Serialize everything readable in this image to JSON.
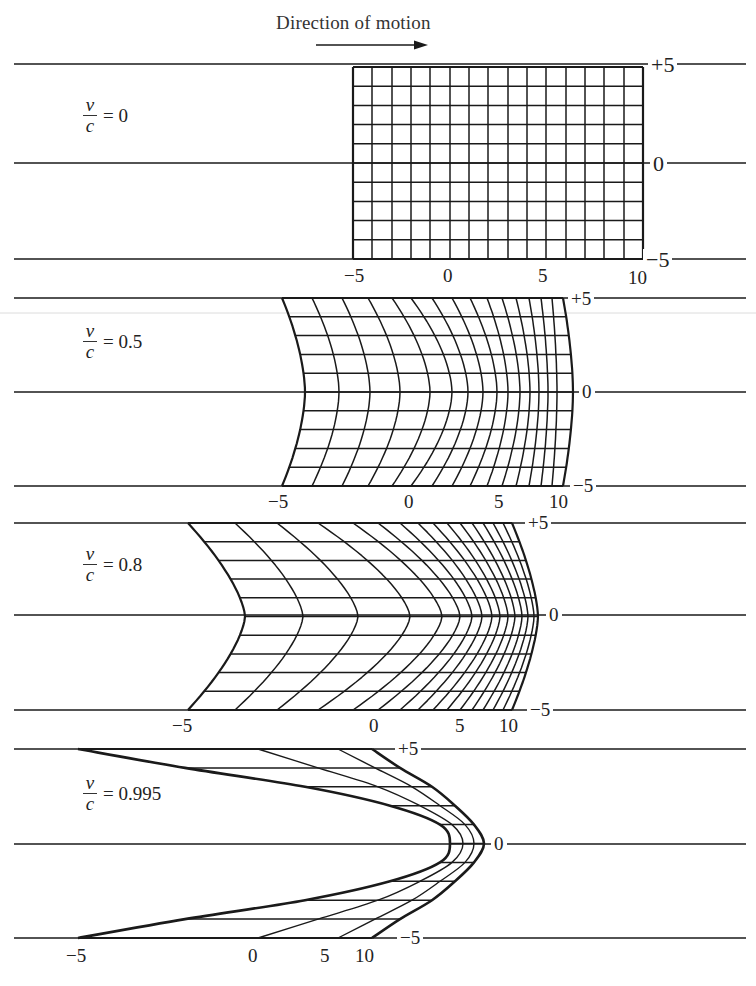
{
  "header": {
    "title": "Direction of motion",
    "arrow": "right-arrow"
  },
  "panels": [
    {
      "id": "v0",
      "ratio_label": {
        "num": "v",
        "den": "c",
        "value": "= 0"
      },
      "beta": 0,
      "ref_lines_y": [
        64,
        163,
        259
      ],
      "rows_y_px": {
        "top": 67,
        "bottom": 259
      },
      "edge_px": [
        353,
        372,
        392,
        411,
        430,
        450,
        469,
        488,
        508,
        527,
        546,
        566,
        585,
        604,
        624,
        643
      ],
      "center_px": [
        353,
        372,
        392,
        411,
        430,
        450,
        469,
        488,
        508,
        527,
        546,
        566,
        585,
        604,
        624,
        643
      ],
      "profile_power": 1.0,
      "x_labels": [
        {
          "text": "−5",
          "x": 344,
          "y": 266
        },
        {
          "text": "0",
          "x": 443,
          "y": 266
        },
        {
          "text": "5",
          "x": 538,
          "y": 266
        },
        {
          "text": "10",
          "x": 628,
          "y": 268
        }
      ],
      "y_labels": [
        {
          "text": "+5",
          "x": 648,
          "y": 54
        },
        {
          "text": "0",
          "x": 650,
          "y": 153
        },
        {
          "text": "−5",
          "x": 643,
          "y": 249
        }
      ],
      "label_pos": {
        "x": 83,
        "y": 96
      }
    },
    {
      "id": "v05",
      "ratio_label": {
        "num": "v",
        "den": "c",
        "value": "= 0.5"
      },
      "beta": 0.5,
      "ref_lines_y": [
        298,
        392,
        486
      ],
      "rows_y_px": {
        "top": 298,
        "bottom": 486
      },
      "edge_px": [
        282,
        312,
        342,
        368,
        392,
        411,
        432,
        452,
        470,
        487,
        502,
        516,
        529,
        541,
        552,
        563
      ],
      "center_px": [
        305,
        339,
        370,
        400,
        430,
        452,
        468,
        483,
        497,
        508,
        520,
        530,
        539,
        548,
        557,
        573
      ],
      "profile_power": 1.7,
      "x_labels": [
        {
          "text": "−5",
          "x": 268,
          "y": 492
        },
        {
          "text": "0",
          "x": 404,
          "y": 492
        },
        {
          "text": "5",
          "x": 494,
          "y": 492
        },
        {
          "text": "10",
          "x": 549,
          "y": 492
        }
      ],
      "y_labels": [
        {
          "text": "+5",
          "x": 568,
          "y": 289
        },
        {
          "text": "0",
          "x": 579,
          "y": 382
        },
        {
          "text": "−5",
          "x": 570,
          "y": 476
        }
      ],
      "label_pos": {
        "x": 83,
        "y": 322
      }
    },
    {
      "id": "v08",
      "ratio_label": {
        "num": "v",
        "den": "c",
        "value": "= 0.8"
      },
      "beta": 0.8,
      "ref_lines_y": [
        523,
        615,
        710
      ],
      "rows_y_px": {
        "top": 523,
        "bottom": 710
      },
      "edge_px": [
        188,
        235,
        277,
        318,
        353,
        378,
        400,
        418,
        433,
        447,
        460,
        472,
        483,
        493,
        503,
        512
      ],
      "center_px": [
        245,
        303,
        358,
        410,
        442,
        460,
        472,
        482,
        492,
        500,
        508,
        515,
        522,
        528,
        534,
        538
      ],
      "profile_power": 1.5,
      "x_labels": [
        {
          "text": "−5",
          "x": 172,
          "y": 716
        },
        {
          "text": "0",
          "x": 369,
          "y": 716
        },
        {
          "text": "5",
          "x": 455,
          "y": 716
        },
        {
          "text": "10",
          "x": 499,
          "y": 716
        }
      ],
      "y_labels": [
        {
          "text": "+5",
          "x": 525,
          "y": 513
        },
        {
          "text": "0",
          "x": 546,
          "y": 605
        },
        {
          "text": "−5",
          "x": 527,
          "y": 700
        }
      ],
      "label_pos": {
        "x": 83,
        "y": 545
      }
    },
    {
      "id": "v0995",
      "ratio_label": {
        "num": "v",
        "den": "c",
        "value": "= 0.995"
      },
      "beta": 0.995,
      "ref_lines_y": [
        749,
        844,
        938
      ],
      "rows_y_px": {
        "top": 749,
        "bottom": 938
      },
      "sampled_curves": [
        {
          "x": -5,
          "px_by_abs_row": [
            450,
            440,
            390,
            305,
            185,
            78
          ]
        },
        {
          "x": 0,
          "px_by_abs_row": [
            463,
            452,
            420,
            378,
            318,
            258
          ]
        },
        {
          "x": 5,
          "px_by_abs_row": [
            474,
            465,
            440,
            412,
            375,
            338
          ]
        },
        {
          "x": 10,
          "px_by_abs_row": [
            484,
            474,
            455,
            432,
            400,
            372
          ]
        }
      ],
      "x_labels": [
        {
          "text": "−5",
          "x": 66,
          "y": 946
        },
        {
          "text": "0",
          "x": 248,
          "y": 946
        },
        {
          "text": "5",
          "x": 320,
          "y": 946
        },
        {
          "text": "10",
          "x": 355,
          "y": 946
        }
      ],
      "y_labels": [
        {
          "text": "+5",
          "x": 395,
          "y": 739
        },
        {
          "text": "0",
          "x": 491,
          "y": 834
        },
        {
          "text": "−5",
          "x": 397,
          "y": 928
        }
      ],
      "label_pos": {
        "x": 83,
        "y": 774
      }
    }
  ],
  "ref_line_extent": {
    "x_start": 14,
    "x_end": 746
  },
  "colors": {
    "ink": "#1a1a1a",
    "paper": "#ffffff",
    "artifact": "#d8d8d8"
  },
  "chart_data": {
    "type": "diagram",
    "title": "Direction of motion",
    "series": [
      {
        "name": "v/c = 0",
        "beta": 0,
        "grid_x": [
          -5,
          10
        ],
        "grid_y": [
          -5,
          5
        ],
        "vertical_lines": 16,
        "horizontal_lines": 11
      },
      {
        "name": "v/c = 0.5",
        "beta": 0.5,
        "vertical_lines": 16,
        "horizontal_lines": 11
      },
      {
        "name": "v/c = 0.8",
        "beta": 0.8,
        "vertical_lines": 16,
        "horizontal_lines": 11
      },
      {
        "name": "v/c = 0.995",
        "beta": 0.995,
        "vertical_lines": 4,
        "vertical_line_x": [
          -5,
          0,
          5,
          10
        ],
        "horizontal_lines": 11
      }
    ],
    "x_tick_labels": [
      "-5",
      "0",
      "5",
      "10"
    ],
    "y_tick_labels": [
      "+5",
      "0",
      "-5"
    ]
  }
}
